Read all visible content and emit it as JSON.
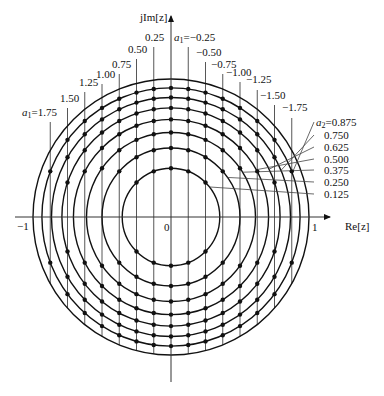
{
  "figure": {
    "type": "z-plane pole locus diagram",
    "axes": {
      "real_label": "Re[z]",
      "imag_label": "jIm[z]",
      "tick_minus_one": "−1",
      "tick_zero": "0",
      "tick_one": "1"
    },
    "geometry": {
      "center_x": 171,
      "center_y": 217,
      "unit_radius_px": 138
    },
    "a1_lines": [
      {
        "a1": 1.75,
        "label": "1.75",
        "prefix": true,
        "lx": 22,
        "ly": 116,
        "top": 122
      },
      {
        "a1": 1.5,
        "label": "1.50",
        "prefix": false,
        "lx": 60,
        "ly": 102,
        "top": 108
      },
      {
        "a1": 1.25,
        "label": "1.25",
        "prefix": false,
        "lx": 79,
        "ly": 86,
        "top": 92
      },
      {
        "a1": 1.0,
        "label": "1.00",
        "prefix": false,
        "lx": 96,
        "ly": 78,
        "top": 84
      },
      {
        "a1": 0.75,
        "label": "0.75",
        "prefix": false,
        "lx": 112,
        "ly": 68,
        "top": 74
      },
      {
        "a1": 0.5,
        "label": "0.50",
        "prefix": false,
        "lx": 128,
        "ly": 53,
        "top": 59
      },
      {
        "a1": 0.25,
        "label": "0.25",
        "prefix": false,
        "lx": 145,
        "ly": 41,
        "top": 47
      },
      {
        "a1": -0.25,
        "label": "−0.25",
        "prefix": true,
        "lx": 174,
        "ly": 41,
        "top": 47
      },
      {
        "a1": -0.5,
        "label": "−0.50",
        "prefix": false,
        "lx": 196,
        "ly": 56,
        "top": 62
      },
      {
        "a1": -0.75,
        "label": "−0.75",
        "prefix": false,
        "lx": 211,
        "ly": 68,
        "top": 74
      },
      {
        "a1": -1.0,
        "label": "−1.00",
        "prefix": false,
        "lx": 226,
        "ly": 76,
        "top": 82
      },
      {
        "a1": -1.25,
        "label": "−1.25",
        "prefix": false,
        "lx": 246,
        "ly": 83,
        "top": 90
      },
      {
        "a1": -1.5,
        "label": "−1.50",
        "prefix": false,
        "lx": 260,
        "ly": 99,
        "top": 105
      },
      {
        "a1": -1.75,
        "label": "−1.75",
        "prefix": false,
        "lx": 282,
        "ly": 111,
        "top": 118
      }
    ],
    "a2_circles": [
      {
        "a2": 0.875,
        "label": "0.875",
        "prefix": true,
        "ly": 126
      },
      {
        "a2": 0.75,
        "label": "0.750",
        "prefix": false,
        "ly": 139
      },
      {
        "a2": 0.625,
        "label": "0.625",
        "prefix": false,
        "ly": 151
      },
      {
        "a2": 0.5,
        "label": "0.500",
        "prefix": false,
        "ly": 163
      },
      {
        "a2": 0.375,
        "label": "0.375",
        "prefix": false,
        "ly": 174
      },
      {
        "a2": 0.25,
        "label": "0.250",
        "prefix": false,
        "ly": 186
      },
      {
        "a2": 0.125,
        "label": "0.125",
        "prefix": false,
        "ly": 198
      }
    ],
    "a1_prefix": "a",
    "a1_sub": "1",
    "a2_prefix": "a",
    "a2_sub": "2",
    "eq": "="
  }
}
